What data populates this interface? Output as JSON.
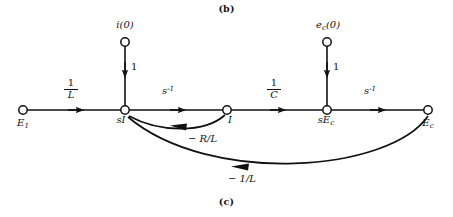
{
  "figure": {
    "caption_top": "(b)",
    "caption_bottom": "(c)",
    "stroke_color": "#111111",
    "node_fill": "#ffffff"
  },
  "nodes": [
    {
      "id": "E1",
      "label_main": "E",
      "label_sub": "1",
      "x": 23,
      "y": 110,
      "label_x": 23,
      "label_y": 120,
      "role": "source-input"
    },
    {
      "id": "sI",
      "label_main": "sI",
      "label_sub": "",
      "x": 125,
      "y": 110,
      "label_x": 121,
      "label_y": 118,
      "role": "mixed"
    },
    {
      "id": "I",
      "label_main": "I",
      "label_sub": "",
      "x": 227,
      "y": 110,
      "label_x": 230,
      "label_y": 118,
      "role": "mixed"
    },
    {
      "id": "sEc",
      "label_main": "sE",
      "label_sub": "c",
      "x": 327,
      "y": 110,
      "label_x": 322,
      "label_y": 118,
      "role": "mixed"
    },
    {
      "id": "Ec",
      "label_main": "E",
      "label_sub": "c",
      "x": 428,
      "y": 110,
      "label_x": 426,
      "label_y": 120,
      "role": "output"
    },
    {
      "id": "i0",
      "label_main": "i(0)",
      "label_sub": "",
      "x": 125,
      "y": 42,
      "label_x": 125,
      "label_y": 22,
      "role": "initial-condition"
    },
    {
      "id": "ec0",
      "label_main": "e",
      "label_sub": "c",
      "label_tail": "(0)",
      "x": 327,
      "y": 42,
      "label_x": 327,
      "label_y": 22,
      "role": "initial-condition"
    }
  ],
  "edges": [
    {
      "id": "E1-sI",
      "from": "E1",
      "to": "sI",
      "gain_num": "1",
      "gain_den": "L",
      "gain_text": "1/L",
      "kind": "fraction",
      "label_x": 70,
      "label_y": 82
    },
    {
      "id": "i0-sI",
      "from": "i0",
      "to": "sI",
      "gain_text": "1",
      "kind": "plain",
      "label_x": 132,
      "label_y": 66
    },
    {
      "id": "sI-I",
      "from": "sI",
      "to": "I",
      "gain_base": "s",
      "gain_exp": "-1",
      "gain_text": "s^-1",
      "kind": "power",
      "label_x": 169,
      "label_y": 90
    },
    {
      "id": "I-sEc",
      "from": "I",
      "to": "sEc",
      "gain_num": "1",
      "gain_den": "C",
      "gain_text": "1/C",
      "kind": "fraction",
      "label_x": 273,
      "label_y": 82
    },
    {
      "id": "ec0-sEc",
      "from": "ec0",
      "to": "sEc",
      "gain_text": "1",
      "kind": "plain",
      "label_x": 334,
      "label_y": 66
    },
    {
      "id": "sEc-Ec",
      "from": "sEc",
      "to": "Ec",
      "gain_base": "s",
      "gain_exp": "-1",
      "gain_text": "s^-1",
      "kind": "power",
      "label_x": 371,
      "label_y": 90
    },
    {
      "id": "I-sI",
      "from": "I",
      "to": "sI",
      "gain_text": "− R/L",
      "kind": "plain",
      "label_x": 188,
      "label_y": 136,
      "feedback": true
    },
    {
      "id": "Ec-sI",
      "from": "Ec",
      "to": "sI",
      "gain_text": "− 1/L",
      "kind": "plain",
      "label_x": 228,
      "label_y": 176,
      "feedback": true
    }
  ]
}
